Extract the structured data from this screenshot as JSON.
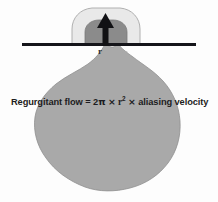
{
  "figure": {
    "background_color": "#fdfdfd",
    "width": 218,
    "height": 202
  },
  "diagram": {
    "chamber": {
      "name": "ventricle-blob",
      "fill": "#a9a9a9",
      "stroke": "#8f8f8f"
    },
    "outer_hemisphere": {
      "name": "outer-aliasing-dome",
      "fill": "#e9e9e9",
      "stroke": "#b0b0b0"
    },
    "inner_hemisphere": {
      "name": "inner-convergence-dome",
      "fill": "#8b8b8b",
      "stroke": "#7a7a7a"
    },
    "valve_plane": {
      "name": "valve-plane-line",
      "color": "#15151a"
    },
    "flow_arrow": {
      "name": "flow-arrow",
      "color": "#111114",
      "direction": "up"
    }
  },
  "labels": {
    "radius": "r",
    "formula": {
      "lead": "Regurgitant flow =",
      "coefficient": "2",
      "pi": "π",
      "times_1": "×",
      "radius_var": "r",
      "exponent": "2",
      "times_2": "×",
      "trailing": "aliasing velocity"
    }
  }
}
